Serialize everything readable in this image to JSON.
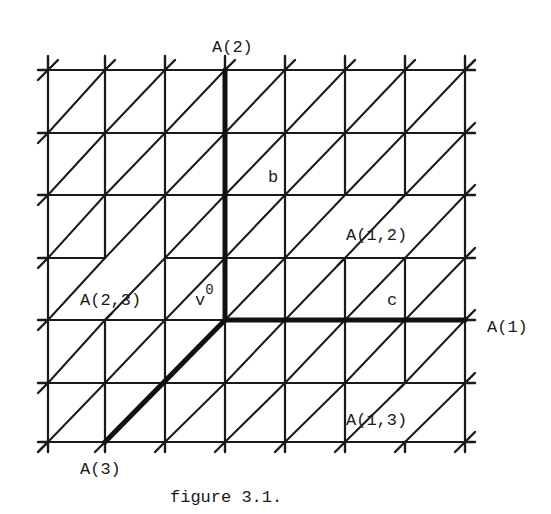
{
  "figure": {
    "caption": "figure 3.1.",
    "grid": {
      "x": [
        48,
        105,
        165,
        225,
        285,
        345,
        405,
        465
      ],
      "y": [
        70,
        133,
        195,
        258,
        320,
        383,
        442
      ],
      "stroke": "#1a1a1a"
    },
    "origin": {
      "label": "v",
      "superscript": "0",
      "x": 225,
      "y": 320
    },
    "axes": [
      {
        "name": "A(2)",
        "edge_label": "b",
        "from": [
          225,
          320
        ],
        "to": [
          225,
          70
        ]
      },
      {
        "name": "A(1)",
        "edge_label": "c",
        "from": [
          225,
          320
        ],
        "to": [
          465,
          320
        ]
      },
      {
        "name": "A(3)",
        "edge_label": "",
        "from": [
          225,
          320
        ],
        "to": [
          105,
          442
        ]
      }
    ],
    "labels": {
      "a2": "A(2)",
      "a1": "A(1)",
      "a3": "A(3)",
      "a12": "A(1,2)",
      "a13": "A(1,3)",
      "a23": "A(2,3)",
      "b": "b",
      "c": "c",
      "v": "v",
      "v_sup": "0"
    },
    "missing_segments": [
      {
        "type": "vertical",
        "x": 345,
        "y1": 195,
        "y2": 258
      },
      {
        "type": "vertical",
        "x": 405,
        "y1": 195,
        "y2": 258
      },
      {
        "type": "vertical",
        "x": 405,
        "y1": 383,
        "y2": 442
      },
      {
        "type": "vertical",
        "x": 105,
        "y1": 258,
        "y2": 320
      },
      {
        "type": "horizontal",
        "y": 258,
        "x1": 105,
        "x2": 165
      }
    ]
  }
}
